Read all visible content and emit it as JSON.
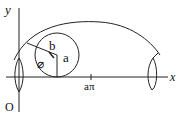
{
  "diagram": {
    "labels": {
      "y_axis": "y",
      "x_axis": "x",
      "origin": "O",
      "radius_label": "a",
      "distance_label": "b",
      "angle_label": "⌀",
      "x_tick": "aπ"
    },
    "colors": {
      "stroke": "#222222",
      "background": "#ffffff"
    }
  }
}
